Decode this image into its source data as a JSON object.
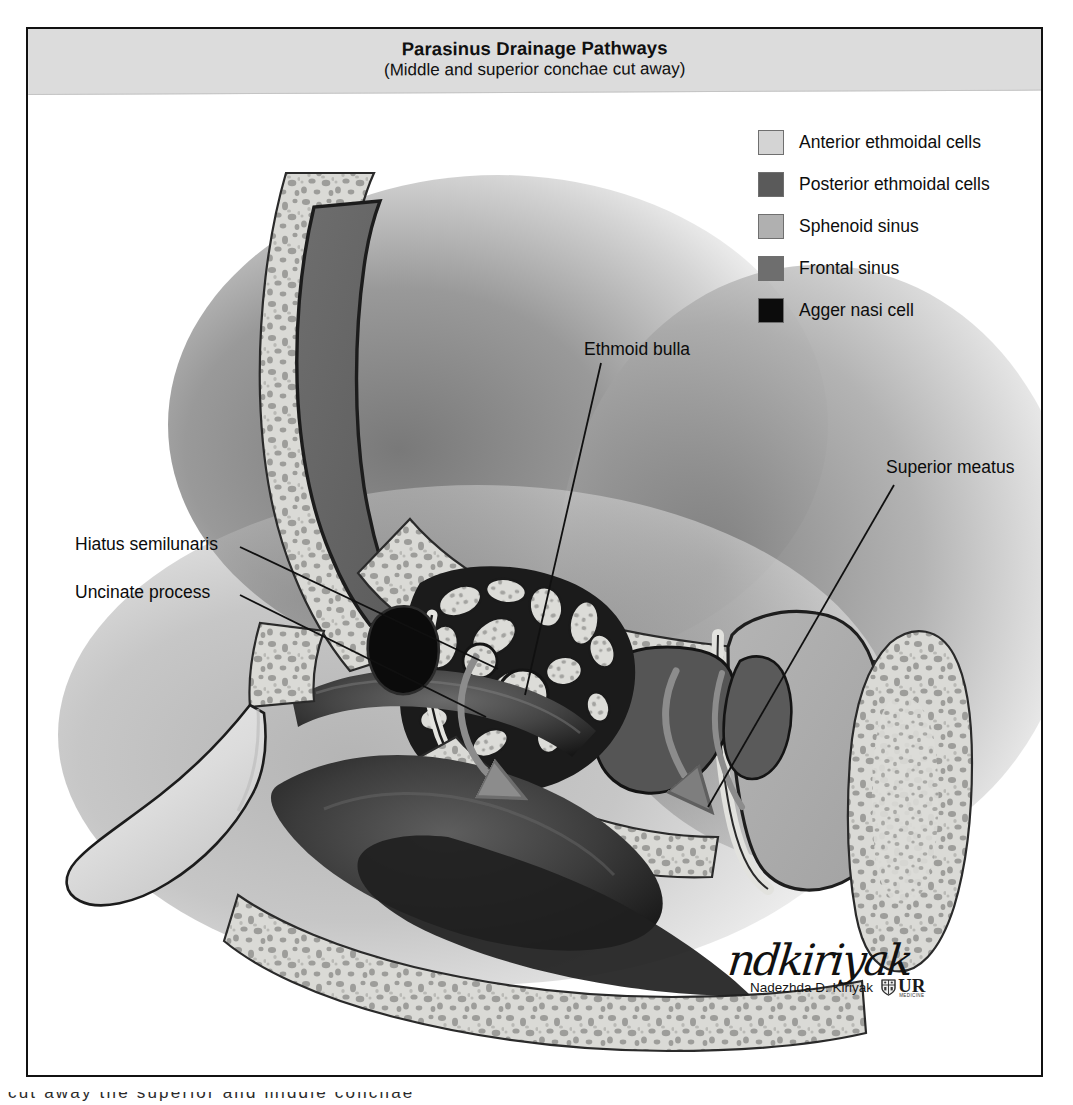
{
  "figure": {
    "title": "Parasinus Drainage Pathways",
    "subtitle": "(Middle and superior conchae cut away)",
    "type": "anatomical-illustration",
    "view": "sagittal section of lateral nasal wall"
  },
  "legend": {
    "items": [
      {
        "label": "Anterior ethmoidal cells",
        "color": "#d4d4d4",
        "key": "anterior-ethmoidal-cells"
      },
      {
        "label": "Posterior ethmoidal cells",
        "color": "#5a5a5a",
        "key": "posterior-ethmoidal-cells"
      },
      {
        "label": "Sphenoid sinus",
        "color": "#b0b0b0",
        "key": "sphenoid-sinus"
      },
      {
        "label": "Frontal sinus",
        "color": "#6e6e6e",
        "key": "frontal-sinus"
      },
      {
        "label": "Agger nasi cell",
        "color": "#0c0c0c",
        "key": "agger-nasi-cell"
      }
    ]
  },
  "annotations": {
    "ethmoid_bulla": "Ethmoid bulla",
    "superior_meatus": "Superior meatus",
    "hiatus_semilunaris": "Hiatus semilunaris",
    "uncinate_process": "Uncinate process"
  },
  "signature": {
    "script": "ndkiriyak",
    "name": "Nadezhda D. Kiriyak",
    "logo_text": "UR",
    "logo_subtext": "MEDICINE"
  },
  "page_bleed": {
    "text": "cut away the superior and middle conchae"
  },
  "palette": {
    "frame_border": "#111111",
    "title_banner": "#dcdcdc",
    "bone_light": "#d8d8d5",
    "bone_outline": "#2a2a2a",
    "marrow_speckle": "#9a9a9a",
    "air_dark": "#141414",
    "mucosa_mid": "#4a4a4a",
    "arrow_gray": "#8c8c8c",
    "leader_line": "#101010",
    "background": "#ffffff"
  }
}
